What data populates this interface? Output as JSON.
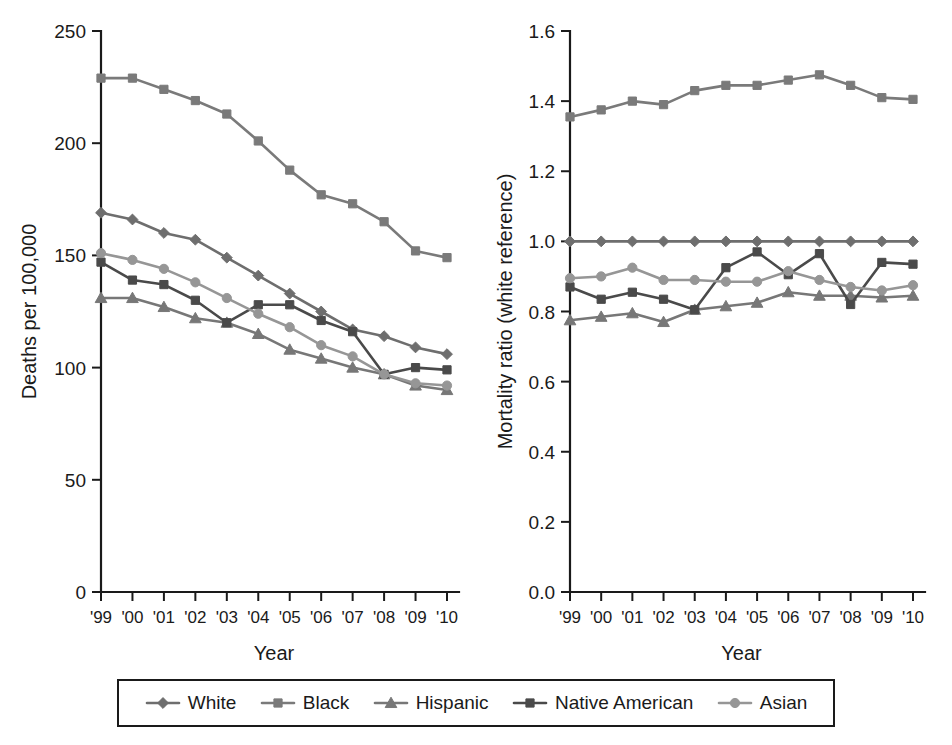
{
  "figure": {
    "background": "#ffffff",
    "panels": [
      "left",
      "right"
    ]
  },
  "legend": {
    "position": "bottom",
    "bordered": true,
    "entries": [
      {
        "label": "White",
        "color": "#6e6e6e",
        "marker": "diamond"
      },
      {
        "label": "Black",
        "color": "#7a7a7a",
        "marker": "square"
      },
      {
        "label": "Hispanic",
        "color": "#777777",
        "marker": "triangle"
      },
      {
        "label": "Native American",
        "color": "#4a4a4a",
        "marker": "square"
      },
      {
        "label": "Asian",
        "color": "#969696",
        "marker": "circle"
      }
    ]
  },
  "chart_data": [
    {
      "id": "deaths-per-100000",
      "type": "line",
      "title": "",
      "xlabel": "Year",
      "ylabel": "Deaths per 100,000",
      "categories": [
        "'99",
        "'00",
        "'01",
        "'02",
        "'03",
        "'04",
        "'05",
        "'06",
        "'07",
        "'08",
        "'09",
        "'10"
      ],
      "x": [
        1999,
        2000,
        2001,
        2002,
        2003,
        2004,
        2005,
        2006,
        2007,
        2008,
        2009,
        2010
      ],
      "ylim": [
        0,
        250
      ],
      "yticks": [
        0,
        50,
        100,
        150,
        200,
        250
      ],
      "ytick_labels": [
        "0",
        "50",
        "100",
        "150",
        "200",
        "250"
      ],
      "grid": false,
      "legend_position": "below-figure",
      "series": [
        {
          "name": "White",
          "color": "#6e6e6e",
          "marker": "diamond",
          "values": [
            169,
            166,
            160,
            157,
            149,
            141,
            133,
            125,
            117,
            114,
            109,
            106
          ]
        },
        {
          "name": "Black",
          "color": "#7a7a7a",
          "marker": "square",
          "values": [
            229,
            229,
            224,
            219,
            213,
            201,
            188,
            177,
            173,
            165,
            152,
            149
          ]
        },
        {
          "name": "Hispanic",
          "color": "#777777",
          "marker": "triangle",
          "values": [
            131,
            131,
            127,
            122,
            120,
            115,
            108,
            104,
            100,
            97,
            92,
            90
          ]
        },
        {
          "name": "Native American",
          "color": "#4a4a4a",
          "marker": "square",
          "values": [
            147,
            139,
            137,
            130,
            120,
            128,
            128,
            121,
            116,
            97,
            100,
            99
          ]
        },
        {
          "name": "Asian",
          "color": "#969696",
          "marker": "circle",
          "values": [
            151,
            148,
            144,
            138,
            131,
            124,
            118,
            110,
            105,
            97,
            93,
            92
          ]
        }
      ]
    },
    {
      "id": "mortality-ratio-white-reference",
      "type": "line",
      "title": "",
      "xlabel": "Year",
      "ylabel": "Mortality ratio (white reference)",
      "categories": [
        "'99",
        "'00",
        "'01",
        "'02",
        "'03",
        "'04",
        "'05",
        "'06",
        "'07",
        "'08",
        "'09",
        "'10"
      ],
      "x": [
        1999,
        2000,
        2001,
        2002,
        2003,
        2004,
        2005,
        2006,
        2007,
        2008,
        2009,
        2010
      ],
      "ylim": [
        0.0,
        1.6
      ],
      "yticks": [
        0.0,
        0.2,
        0.4,
        0.6,
        0.8,
        1.0,
        1.2,
        1.4,
        1.6
      ],
      "ytick_labels": [
        "0.0",
        "0.2",
        "0.4",
        "0.6",
        "0.8",
        "1.0",
        "1.2",
        "1.4",
        "1.6"
      ],
      "grid": false,
      "legend_position": "below-figure",
      "series": [
        {
          "name": "White",
          "color": "#6e6e6e",
          "marker": "diamond",
          "values": [
            1.0,
            1.0,
            1.0,
            1.0,
            1.0,
            1.0,
            1.0,
            1.0,
            1.0,
            1.0,
            1.0,
            1.0
          ]
        },
        {
          "name": "Black",
          "color": "#7a7a7a",
          "marker": "square",
          "values": [
            1.355,
            1.375,
            1.4,
            1.39,
            1.43,
            1.445,
            1.445,
            1.46,
            1.475,
            1.445,
            1.41,
            1.405
          ]
        },
        {
          "name": "Hispanic",
          "color": "#777777",
          "marker": "triangle",
          "values": [
            0.775,
            0.785,
            0.795,
            0.77,
            0.805,
            0.815,
            0.825,
            0.855,
            0.845,
            0.845,
            0.84,
            0.845
          ]
        },
        {
          "name": "Native American",
          "color": "#4a4a4a",
          "marker": "square",
          "values": [
            0.87,
            0.835,
            0.855,
            0.835,
            0.805,
            0.925,
            0.97,
            0.905,
            0.965,
            0.82,
            0.94,
            0.935
          ]
        },
        {
          "name": "Asian",
          "color": "#969696",
          "marker": "circle",
          "values": [
            0.895,
            0.9,
            0.925,
            0.89,
            0.89,
            0.885,
            0.885,
            0.915,
            0.89,
            0.87,
            0.86,
            0.875
          ]
        }
      ]
    }
  ]
}
